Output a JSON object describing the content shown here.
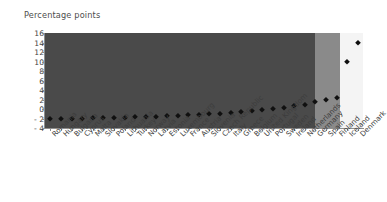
{
  "chart_data": {
    "type": "scatter",
    "title": "Percentage points",
    "xlabel": "",
    "ylabel": "Percentage points",
    "ylim": [
      -4,
      16
    ],
    "yticks": [
      -4,
      -2,
      0,
      2,
      4,
      6,
      8,
      10,
      12,
      14,
      16
    ],
    "ytick_labels": [
      "- 4",
      "- 2",
      "0",
      "2",
      "4",
      "6",
      "8",
      "10",
      "12",
      "14",
      "16"
    ],
    "grid": false,
    "legend": null,
    "marker_style": "diamond",
    "marker_color": "#101010",
    "categories": [
      "Romania",
      "Hungary",
      "Bulgaria",
      "Cyprus",
      "Malta",
      "Slovakia",
      "Poland",
      "Lithuania",
      "Turkey",
      "Norway",
      "Latvia",
      "Estonia",
      "Luxembourg",
      "France",
      "Austria",
      "Slovenia",
      "Czech Republic",
      "Italy",
      "Greece",
      "Belgium",
      "United Kingdom",
      "Portugal",
      "Sweden",
      "Ireland",
      "Netherlands",
      "Germany",
      "Spain",
      "Finland",
      "Iceland",
      "Denmark"
    ],
    "values": [
      -2.1,
      -2.1,
      -2.0,
      -2.0,
      -1.9,
      -1.9,
      -1.8,
      -1.8,
      -1.7,
      -1.7,
      -1.6,
      -1.5,
      -1.4,
      -1.3,
      -1.2,
      -1.1,
      -1.0,
      -0.9,
      -0.7,
      -0.5,
      -0.3,
      0.0,
      0.3,
      0.6,
      0.9,
      1.4,
      2.0,
      2.3,
      10.0,
      14.0
    ],
    "background_bands": [
      {
        "name": "main-band",
        "color": "#4a4a4a",
        "from_index": 0,
        "to_index": 26
      },
      {
        "name": "mid-band",
        "color": "#8a8a8a",
        "from_index": 27,
        "to_index": 28
      },
      {
        "name": "light-band",
        "color": "#f4f4f4",
        "from_index": 29,
        "to_index": 29
      }
    ]
  },
  "colors": {
    "page_background": "#ffffff",
    "plot_dark": "#4a4a4a",
    "plot_mid": "#8a8a8a",
    "plot_light": "#f4f4f4",
    "axis": "#8e8e8e",
    "text": "#3f3f3f",
    "marker": "#101010"
  }
}
